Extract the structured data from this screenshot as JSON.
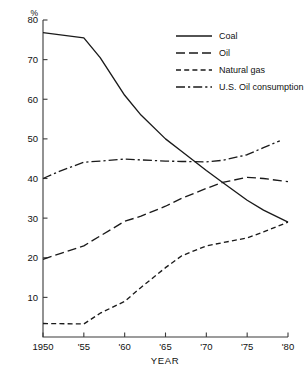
{
  "chart_data": {
    "type": "line",
    "title": "",
    "subtitle": "",
    "xlabel": "YEAR",
    "ylabel": "%",
    "ylabel_position": "top-left-of-axis",
    "xlim": [
      1950,
      1980
    ],
    "ylim": [
      0,
      80
    ],
    "yticks": [
      10,
      20,
      30,
      40,
      50,
      60,
      70,
      80
    ],
    "ytick_labels": [
      "10",
      "20",
      "30",
      "40",
      "50",
      "60",
      "70",
      "80"
    ],
    "xticks": [
      1950,
      1955,
      1960,
      1965,
      1970,
      1975,
      1980
    ],
    "xtick_labels": [
      "1950",
      "'55",
      "'60",
      "'65",
      "'70",
      "'75",
      "'80"
    ],
    "grid": false,
    "legend_position": "top-right",
    "series": [
      {
        "name": "Coal",
        "dash": "solid",
        "color": "#1a1a1a",
        "x": [
          1950,
          1955,
          1957,
          1960,
          1962,
          1965,
          1967,
          1970,
          1972,
          1975,
          1977,
          1980
        ],
        "values": [
          76.8,
          75.5,
          70.5,
          61.0,
          56.0,
          50.0,
          46.8,
          42.0,
          39.0,
          34.5,
          32.0,
          29.0
        ]
      },
      {
        "name": "Oil",
        "dash": "long-dash",
        "color": "#1a1a1a",
        "x": [
          1950,
          1952,
          1955,
          1957,
          1960,
          1962,
          1965,
          1967,
          1970,
          1972,
          1975,
          1977,
          1980
        ],
        "values": [
          19.6,
          21.0,
          23.0,
          25.5,
          29.2,
          30.5,
          33.0,
          35.0,
          37.5,
          39.0,
          40.3,
          40.0,
          39.2
        ]
      },
      {
        "name": "Natural gas",
        "dash": "short-dash",
        "color": "#1a1a1a",
        "x": [
          1950,
          1955,
          1957,
          1960,
          1962,
          1965,
          1967,
          1970,
          1972,
          1975,
          1977,
          1980
        ],
        "values": [
          3.4,
          3.3,
          6.0,
          9.0,
          12.5,
          17.5,
          20.5,
          23.0,
          23.8,
          25.0,
          26.5,
          29.0
        ]
      },
      {
        "name": "U.S. Oil consumption",
        "dash": "dash-dot",
        "color": "#1a1a1a",
        "x": [
          1950,
          1952,
          1955,
          1957,
          1960,
          1962,
          1965,
          1967,
          1970,
          1972,
          1975,
          1977,
          1979
        ],
        "values": [
          40.0,
          41.8,
          44.1,
          44.4,
          44.9,
          44.7,
          44.4,
          44.3,
          44.2,
          44.6,
          46.0,
          47.8,
          49.5
        ]
      }
    ]
  },
  "legend": {
    "items": [
      {
        "label": "Coal",
        "dash": "solid"
      },
      {
        "label": "Oil",
        "dash": "long-dash"
      },
      {
        "label": "Natural gas",
        "dash": "short-dash"
      },
      {
        "label": "U.S. Oil consumption",
        "dash": "dash-dot"
      }
    ]
  }
}
